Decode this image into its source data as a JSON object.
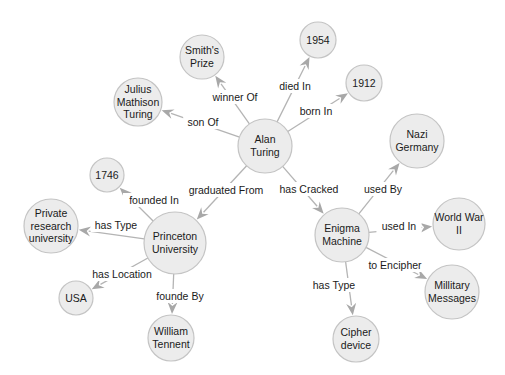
{
  "diagram": {
    "type": "knowledge-graph",
    "colors": {
      "background": "#ffffff",
      "node_fill": "#ececec",
      "node_stroke": "#c4c4c4",
      "edge": "#b4b4b4",
      "arrow": "#a8a8a8",
      "text": "#1a1a1a"
    },
    "nodes": [
      {
        "id": "alan_turing",
        "lines": [
          "Alan",
          "Turing"
        ],
        "x": 265,
        "y": 146,
        "r": 27
      },
      {
        "id": "smiths_prize",
        "lines": [
          "Smith's",
          "Prize"
        ],
        "x": 202,
        "y": 57,
        "r": 22
      },
      {
        "id": "y1954",
        "lines": [
          "1954"
        ],
        "x": 318,
        "y": 40,
        "r": 18
      },
      {
        "id": "y1912",
        "lines": [
          "1912"
        ],
        "x": 364,
        "y": 83,
        "r": 18
      },
      {
        "id": "julius",
        "lines": [
          "Julius",
          "Mathison",
          "Turing"
        ],
        "x": 138,
        "y": 102,
        "r": 24
      },
      {
        "id": "y1746",
        "lines": [
          "1746"
        ],
        "x": 107,
        "y": 175,
        "r": 17
      },
      {
        "id": "private_research",
        "lines": [
          "Private",
          "research",
          "university"
        ],
        "x": 51,
        "y": 226,
        "r": 27
      },
      {
        "id": "princeton",
        "lines": [
          "Princeton",
          "University"
        ],
        "x": 175,
        "y": 243,
        "r": 31
      },
      {
        "id": "usa",
        "lines": [
          "USA"
        ],
        "x": 76,
        "y": 298,
        "r": 17
      },
      {
        "id": "william_tennent",
        "lines": [
          "William",
          "Tennent"
        ],
        "x": 171,
        "y": 338,
        "r": 23
      },
      {
        "id": "nazi_germany",
        "lines": [
          "Nazi",
          "Germany"
        ],
        "x": 417,
        "y": 141,
        "r": 27
      },
      {
        "id": "enigma",
        "lines": [
          "Enigma",
          "Machine"
        ],
        "x": 342,
        "y": 235,
        "r": 27
      },
      {
        "id": "ww2",
        "lines": [
          "World War",
          "II"
        ],
        "x": 459,
        "y": 224,
        "r": 26
      },
      {
        "id": "military_messages",
        "lines": [
          "Millitary",
          "Messages"
        ],
        "x": 452,
        "y": 292,
        "r": 27
      },
      {
        "id": "cipher_device",
        "lines": [
          "Cipher",
          "device"
        ],
        "x": 356,
        "y": 339,
        "r": 23
      }
    ],
    "edges": [
      {
        "from": "alan_turing",
        "to": "smiths_prize",
        "label": "winner Of",
        "lx": 235,
        "ly": 97
      },
      {
        "from": "alan_turing",
        "to": "y1954",
        "label": "died In",
        "lx": 295,
        "ly": 86
      },
      {
        "from": "alan_turing",
        "to": "y1912",
        "label": "born In",
        "lx": 316,
        "ly": 111
      },
      {
        "from": "alan_turing",
        "to": "julius",
        "label": "son Of",
        "lx": 203,
        "ly": 122
      },
      {
        "from": "alan_turing",
        "to": "princeton",
        "label": "graduated From",
        "lx": 226,
        "ly": 190
      },
      {
        "from": "alan_turing",
        "to": "enigma",
        "label": "has Cracked",
        "lx": 309,
        "ly": 189
      },
      {
        "from": "princeton",
        "to": "y1746",
        "label": "founded In",
        "lx": 154,
        "ly": 200
      },
      {
        "from": "princeton",
        "to": "private_research",
        "label": "has Type",
        "lx": 116,
        "ly": 225
      },
      {
        "from": "princeton",
        "to": "usa",
        "label": "has Location",
        "lx": 122,
        "ly": 274
      },
      {
        "from": "princeton",
        "to": "william_tennent",
        "label": "founde By",
        "lx": 180,
        "ly": 296
      },
      {
        "from": "enigma",
        "to": "nazi_germany",
        "label": "used By",
        "lx": 383,
        "ly": 189
      },
      {
        "from": "enigma",
        "to": "ww2",
        "label": "used In",
        "lx": 399,
        "ly": 226
      },
      {
        "from": "enigma",
        "to": "military_messages",
        "label": "to Encipher",
        "lx": 395,
        "ly": 265
      },
      {
        "from": "enigma",
        "to": "cipher_device",
        "label": "has Type",
        "lx": 334,
        "ly": 285
      }
    ]
  }
}
